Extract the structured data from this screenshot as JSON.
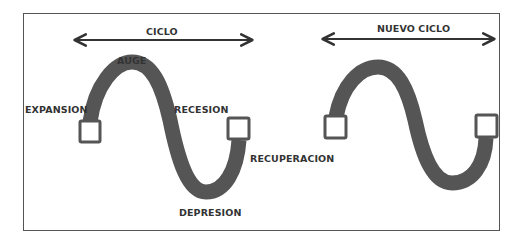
{
  "diagram": {
    "colors": {
      "wave": "#555555",
      "text": "#333333",
      "frame": "#555555",
      "background": "#ffffff"
    },
    "cycles": [
      {
        "label": "CICLO",
        "phases": {
          "start": "EXPANSION",
          "peak": "AUGE",
          "falling": "RECESION",
          "trough": "DEPRESION",
          "end": "RECUPERACION"
        }
      },
      {
        "label": "NUEVO CICLO"
      }
    ]
  }
}
